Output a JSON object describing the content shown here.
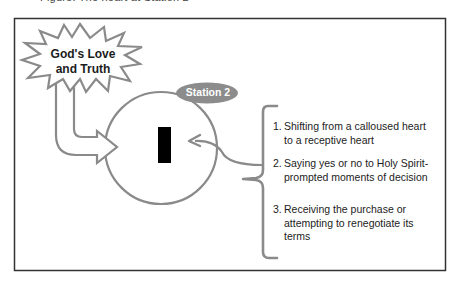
{
  "header": {
    "cut_off_text": "Figure: The heart at Station 2"
  },
  "diagram": {
    "source_label": {
      "line1": "God's Love",
      "line2": "and Truth",
      "shape": "starburst"
    },
    "station_badge": "Station 2",
    "center_marker": "black-bar",
    "items": [
      {
        "num": "1.",
        "text": "Shifting from a calloused heart to a receptive heart"
      },
      {
        "num": "2.",
        "text": "Saying yes or no to Holy Spirit-prompted moments of decision"
      },
      {
        "num": "3.",
        "text": "Receiving the purchase or attempting to renegotiate its terms"
      }
    ],
    "colors": {
      "outline": "#8a8a8a",
      "badge_fill": "#8c8c8c",
      "frame": "#333333",
      "marker": "#000000",
      "text": "#1c1c1c"
    }
  }
}
